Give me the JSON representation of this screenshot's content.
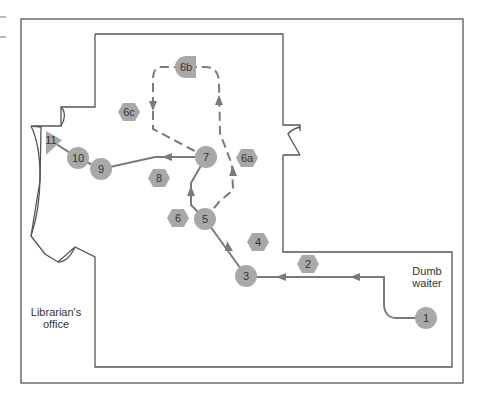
{
  "figure": {
    "title": "",
    "colors": {
      "wall": "#555555",
      "path": "#7a7a7a",
      "node_fill": "#a8a8a8",
      "text": "#333333"
    }
  },
  "rooms": {
    "librarian_office": {
      "line1": "Librarian's",
      "line2": "office"
    },
    "dumb_waiter": {
      "line1": "Dumb",
      "line2": "waiter"
    }
  },
  "nodes": {
    "n1": {
      "label": "1",
      "shape": "circle"
    },
    "n2": {
      "label": "2",
      "shape": "hexagon"
    },
    "n3": {
      "label": "3",
      "shape": "circle"
    },
    "n4": {
      "label": "4",
      "shape": "hexagon"
    },
    "n5": {
      "label": "5",
      "shape": "circle"
    },
    "n6": {
      "label": "6",
      "shape": "hexagon"
    },
    "n6a": {
      "label": "6a",
      "shape": "hexagon"
    },
    "n6b": {
      "label": "6b",
      "shape": "half-circle-square"
    },
    "n6c": {
      "label": "6c",
      "shape": "hexagon"
    },
    "n7": {
      "label": "7",
      "shape": "circle"
    },
    "n8": {
      "label": "8",
      "shape": "hexagon"
    },
    "n9": {
      "label": "9",
      "shape": "circle"
    },
    "n10": {
      "label": "10",
      "shape": "circle"
    },
    "n11": {
      "label": "11",
      "shape": "triangle"
    }
  },
  "paths": {
    "solid_route": [
      "1",
      "3",
      "5",
      "7",
      "9",
      "10",
      "11"
    ],
    "dashed_loop": [
      "5",
      "6b",
      "7"
    ]
  }
}
